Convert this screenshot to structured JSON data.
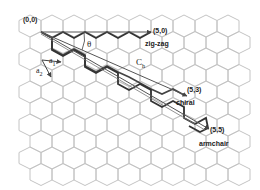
{
  "figure": {
    "type": "graphene-lattice-chirality-diagram",
    "colors": {
      "background": "#ffffff",
      "lattice": "#c4c4c4",
      "paths": "#333333",
      "vectors": "#555555",
      "text": "#222222"
    },
    "labels": {
      "origin": "(0,0)",
      "zigzag_point": "(5,0)",
      "zigzag": "zig-zag",
      "theta": "θ",
      "a1": "a",
      "a1_sub": "1",
      "a2": "a",
      "a2_sub": "2",
      "ch": "C",
      "ch_sub": "h",
      "chiral_point": "(5,3)",
      "chiral": "chiral",
      "armchair_point": "(5,5)",
      "armchair": "armchair"
    },
    "lattice": {
      "hex_width": 22,
      "row_pitch": 16.5,
      "origin_x": 30,
      "origin_y": 26,
      "rows": 10,
      "cols": 11
    },
    "vectors": [
      {
        "name": "zigzag",
        "from": [
          41,
          32
        ],
        "to": [
          151,
          32
        ]
      },
      {
        "name": "chiral",
        "from": [
          41,
          32
        ],
        "to": [
          187,
          96
        ]
      },
      {
        "name": "armchair",
        "from": [
          41,
          32
        ],
        "to": [
          208,
          130
        ]
      }
    ]
  }
}
